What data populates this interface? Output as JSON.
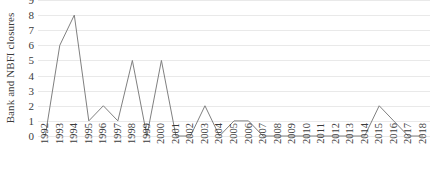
{
  "chart_data": {
    "type": "line",
    "title": "",
    "subtitle": "",
    "xlabel": "",
    "ylabel": "Bank and NBFI closures",
    "categories": [
      "1992",
      "1993",
      "1994",
      "1995",
      "1996",
      "1997",
      "1998",
      "1999",
      "2000",
      "2001",
      "2002",
      "2003",
      "2004",
      "2005",
      "2006",
      "2007",
      "2008",
      "2009",
      "2010",
      "2011",
      "2012",
      "2013",
      "2014",
      "2015",
      "2016",
      "2017",
      "2018"
    ],
    "values": [
      0,
      6,
      8,
      1,
      2,
      1,
      5,
      0,
      5,
      0,
      0,
      2,
      0,
      1,
      1,
      0,
      0,
      0,
      0,
      0,
      0,
      0,
      0,
      2,
      1,
      0,
      0
    ],
    "series": [
      {
        "name": "Bank and NBFI closures",
        "values": [
          0,
          6,
          8,
          1,
          2,
          1,
          5,
          0,
          5,
          0,
          0,
          2,
          0,
          1,
          1,
          0,
          0,
          0,
          0,
          0,
          0,
          0,
          0,
          2,
          1,
          0,
          0
        ]
      }
    ],
    "ylim": [
      0,
      9
    ],
    "yticks": [
      0,
      1,
      2,
      3,
      4,
      5,
      6,
      7,
      8,
      9
    ],
    "ytick_labels": [
      "0",
      "1",
      "2",
      "3",
      "4",
      "5",
      "6",
      "7",
      "8",
      "9"
    ],
    "xlim_categories": [
      "1992",
      "2018"
    ],
    "grid": {
      "horizontal": true,
      "vertical": false,
      "color": "#e9e9e9"
    },
    "legend": {
      "visible": false,
      "position": "none",
      "entries": []
    },
    "line_color": "#808080",
    "line_width": 1,
    "markers": false,
    "background_color": "#ffffff",
    "text_color": "#3b3b3b",
    "annotations": []
  }
}
